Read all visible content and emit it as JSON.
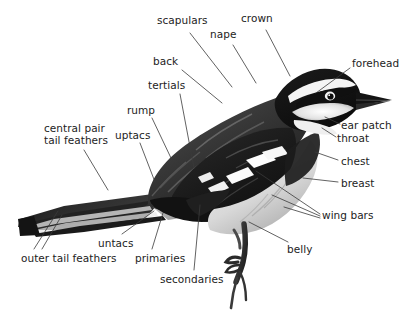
{
  "diagram": {
    "background_color": "#ffffff",
    "text_color": "#232323",
    "leader_line_color": "#3a3a3a",
    "labels": [
      {
        "id": "scapulars",
        "text": "scapulars",
        "x": 157,
        "y": 15,
        "align": "left"
      },
      {
        "id": "nape",
        "text": "nape",
        "x": 210,
        "y": 29,
        "align": "left"
      },
      {
        "id": "crown",
        "text": "crown",
        "x": 241,
        "y": 13,
        "align": "left"
      },
      {
        "id": "forehead",
        "text": "forehead",
        "x": 352,
        "y": 58,
        "align": "left"
      },
      {
        "id": "back",
        "text": "back",
        "x": 153,
        "y": 56,
        "align": "left"
      },
      {
        "id": "tertials",
        "text": "tertials",
        "x": 148,
        "y": 80,
        "align": "left"
      },
      {
        "id": "rump",
        "text": "rump",
        "x": 127,
        "y": 105,
        "align": "left"
      },
      {
        "id": "uptacs",
        "text": "uptacs",
        "x": 115,
        "y": 130,
        "align": "left"
      },
      {
        "id": "central-pair-tail-feathers",
        "text": "central pair\ntail feathers",
        "x": 44,
        "y": 122,
        "align": "left"
      },
      {
        "id": "ear-patch",
        "text": "ear patch",
        "x": 341,
        "y": 120,
        "align": "left"
      },
      {
        "id": "throat",
        "text": "throat",
        "x": 337,
        "y": 133,
        "align": "left"
      },
      {
        "id": "chest",
        "text": "chest",
        "x": 341,
        "y": 156,
        "align": "left"
      },
      {
        "id": "breast",
        "text": "breast",
        "x": 341,
        "y": 178,
        "align": "left"
      },
      {
        "id": "wing-bars",
        "text": "wing bars",
        "x": 322,
        "y": 210,
        "align": "left"
      },
      {
        "id": "belly",
        "text": "belly",
        "x": 287,
        "y": 244,
        "align": "left"
      },
      {
        "id": "untacs",
        "text": "untacs",
        "x": 98,
        "y": 238,
        "align": "left"
      },
      {
        "id": "primaries",
        "text": "primaries",
        "x": 135,
        "y": 253,
        "align": "left"
      },
      {
        "id": "secondaries",
        "text": "secondaries",
        "x": 160,
        "y": 274,
        "align": "left"
      },
      {
        "id": "outer-tail-feathers",
        "text": "outer tail feathers",
        "x": 21,
        "y": 253,
        "align": "left"
      }
    ],
    "leaders": [
      {
        "id": "leader-scapulars",
        "points": "190,33 232,87"
      },
      {
        "id": "leader-nape",
        "points": "233,45 256,83"
      },
      {
        "id": "leader-crown",
        "points": "266,30 290,76"
      },
      {
        "id": "leader-forehead",
        "points": "350,68 316,93"
      },
      {
        "id": "leader-back",
        "points": "182,70 222,103"
      },
      {
        "id": "leader-tertials",
        "points": "180,94 194,168"
      },
      {
        "id": "leader-rump",
        "points": "152,118 171,158"
      },
      {
        "id": "leader-uptacs",
        "points": "140,143 155,182"
      },
      {
        "id": "leader-ctf",
        "points": "84,150 108,190"
      },
      {
        "id": "leader-earpatch",
        "points": "340,124 325,117"
      },
      {
        "id": "leader-throat",
        "points": "336,137 322,128"
      },
      {
        "id": "leader-chest",
        "points": "338,160 315,152"
      },
      {
        "id": "leader-breast",
        "points": "338,182 303,178"
      },
      {
        "id": "leader-wingbars-1",
        "points": "320,214 256,171"
      },
      {
        "id": "leader-wingbars-2",
        "points": "320,216 272,195"
      },
      {
        "id": "leader-wingbars-3",
        "points": "320,218 284,207"
      },
      {
        "id": "leader-belly",
        "points": "288,242 249,222"
      },
      {
        "id": "leader-untacs",
        "points": "122,234 154,211"
      },
      {
        "id": "leader-primaries",
        "points": "152,249 163,213"
      },
      {
        "id": "leader-secondaries",
        "points": "194,270 200,205"
      },
      {
        "id": "leader-otf-1",
        "points": "34,249 58,211"
      },
      {
        "id": "leader-otf-2",
        "points": "42,249 62,215"
      }
    ]
  }
}
